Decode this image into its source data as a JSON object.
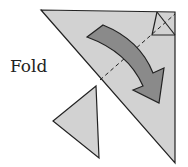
{
  "diagram": {
    "instruction_label": "Fold",
    "colors": {
      "paper": "#d2d2d2",
      "arrow": "#8a8a8a",
      "stroke": "#222222",
      "background": "#ffffff"
    },
    "elements": [
      "main-triangle",
      "corner-square",
      "dashed-fold-line",
      "curved-fold-arrow",
      "small-triangle"
    ]
  }
}
